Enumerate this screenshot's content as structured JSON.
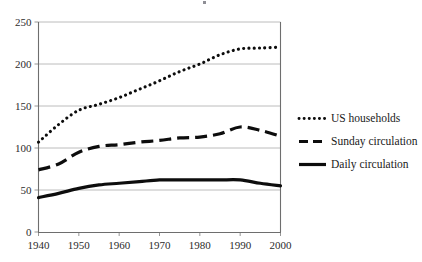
{
  "chart_data": {
    "type": "line",
    "title": "",
    "xlabel": "",
    "ylabel": "",
    "xlim": [
      1940,
      2000
    ],
    "ylim": [
      0,
      250
    ],
    "grid": true,
    "legend_position": "right",
    "x_tick_labels": [
      "1940",
      "1950",
      "1960",
      "1970",
      "1980",
      "1990",
      "2000"
    ],
    "y_tick_labels": [
      "0",
      "50",
      "100",
      "150",
      "200",
      "250"
    ],
    "x": [
      1940,
      1945,
      1950,
      1955,
      1960,
      1965,
      1970,
      1975,
      1980,
      1985,
      1990,
      1995,
      2000
    ],
    "series": [
      {
        "name": "US households",
        "style": "dotted",
        "color": "#0d0d0d",
        "values": [
          107,
          128,
          145,
          152,
          160,
          170,
          180,
          191,
          200,
          211,
          218,
          219,
          220
        ]
      },
      {
        "name": "Sunday circulation",
        "style": "dashed",
        "color": "#0d0d0d",
        "values": [
          74,
          81,
          95,
          102,
          104,
          107,
          109,
          112,
          113,
          117,
          125,
          121,
          114
        ]
      },
      {
        "name": "Daily circulation",
        "style": "solid",
        "color": "#0d0d0d",
        "values": [
          41,
          46,
          52,
          56,
          58,
          60,
          62,
          62,
          62,
          62,
          62,
          58,
          55
        ]
      }
    ]
  },
  "legend": {
    "items": [
      {
        "label": "US households",
        "marker": "dotted-line-marker"
      },
      {
        "label": "Sunday circulation",
        "marker": "dashed-line-marker"
      },
      {
        "label": "Daily circulation",
        "marker": "solid-line-marker"
      }
    ]
  }
}
